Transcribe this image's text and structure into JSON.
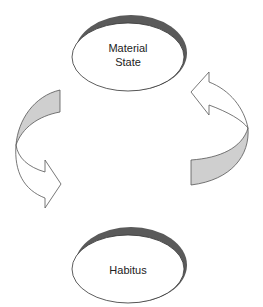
{
  "diagram": {
    "type": "cycle",
    "nodes": [
      {
        "id": "material-state",
        "label_line1": "Material",
        "label_line2": "State",
        "position": "top"
      },
      {
        "id": "habitus",
        "label_line1": "Habitus",
        "position": "bottom"
      }
    ],
    "edges": [
      {
        "from": "material-state",
        "to": "habitus",
        "side": "left",
        "style": "curved-block-arrow"
      },
      {
        "from": "habitus",
        "to": "material-state",
        "side": "right",
        "style": "curved-block-arrow"
      }
    ],
    "colors": {
      "node_fill": "#ffffff",
      "node_stroke": "#333333",
      "node_shadow": "#555555",
      "arrow_band_fill": "#cfcfcf",
      "arrow_stroke": "#555555",
      "text": "#222222"
    }
  }
}
